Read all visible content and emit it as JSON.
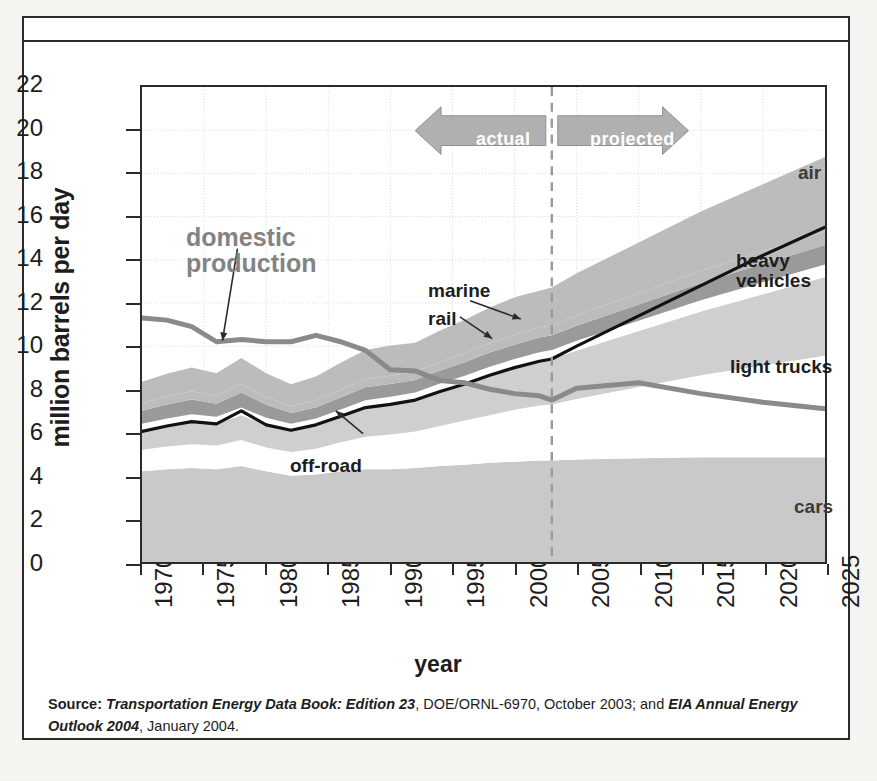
{
  "figure": {
    "ylabel": "million barrels per day",
    "xlabel": "year",
    "source_prefix": "Source:",
    "source_italic_1": "Transportation Energy Data Book: Edition 23",
    "source_mid": ", DOE/ORNL-6970, October 2003; and ",
    "source_italic_2": "EIA Annual Energy Outlook 2004",
    "source_tail": ", January 2004."
  },
  "annotations": {
    "domestic_production": "domestic\nproduction",
    "domestic_production_line1": "domestic",
    "domestic_production_line2": "production",
    "marine": "marine",
    "rail": "rail",
    "off_road": "off-road",
    "air": "air",
    "heavy_vehicles_line1": "heavy",
    "heavy_vehicles_line2": "vehicles",
    "light_trucks": "light trucks",
    "cars": "cars",
    "actual": "actual",
    "projected": "projected"
  },
  "colors": {
    "cars_band": "#c9c9c9",
    "light_trucks_band": "#ffffff",
    "heavy_vehicles_band": "#cfcfcf",
    "rail_band": "#ffffff",
    "marine_band": "#9a9a9a",
    "air_band": "#bcbcbc",
    "total_line": "#111111",
    "domestic_line": "#8a8a8a",
    "axis": "#2b2b2b",
    "grid": "#d8d8d8",
    "divider": "#9a9a9a",
    "arrow_fill": "#b0b0b0"
  },
  "chart_data": {
    "type": "area",
    "title": "",
    "subtitle": "",
    "xlabel": "year",
    "ylabel": "million barrels per day",
    "xlim": [
      1970,
      2025
    ],
    "ylim": [
      0,
      22
    ],
    "yticks": [
      0,
      2,
      4,
      6,
      8,
      10,
      12,
      14,
      16,
      18,
      20,
      22
    ],
    "xticks": [
      1970,
      1975,
      1980,
      1985,
      1990,
      1995,
      2000,
      2005,
      2010,
      2015,
      2020,
      2025
    ],
    "grid": true,
    "legend": "inline-labels-right",
    "stacked": true,
    "divider_year": 2003,
    "divider_label_left": "actual",
    "divider_label_right": "projected",
    "x": [
      1970,
      1972,
      1974,
      1976,
      1978,
      1980,
      1982,
      1984,
      1986,
      1988,
      1990,
      1992,
      1994,
      1996,
      1998,
      2000,
      2002,
      2003,
      2005,
      2010,
      2015,
      2020,
      2025
    ],
    "series": [
      {
        "name": "cars",
        "order": 1,
        "values": [
          4.2,
          4.3,
          4.35,
          4.3,
          4.45,
          4.2,
          4.0,
          4.05,
          4.2,
          4.3,
          4.3,
          4.35,
          4.45,
          4.5,
          4.6,
          4.65,
          4.7,
          4.7,
          4.75,
          4.8,
          4.85,
          4.85,
          4.85
        ]
      },
      {
        "name": "light trucks",
        "order": 2,
        "values": [
          1.0,
          1.05,
          1.1,
          1.1,
          1.2,
          1.1,
          1.1,
          1.2,
          1.35,
          1.5,
          1.6,
          1.7,
          1.85,
          2.05,
          2.2,
          2.4,
          2.55,
          2.6,
          2.8,
          3.3,
          3.8,
          4.25,
          4.7
        ]
      },
      {
        "name": "heavy vehicles",
        "order": 3,
        "values": [
          0.85,
          0.95,
          1.05,
          1.0,
          1.15,
          1.05,
          1.0,
          1.1,
          1.2,
          1.35,
          1.4,
          1.45,
          1.6,
          1.7,
          1.85,
          1.95,
          2.05,
          2.1,
          2.25,
          2.6,
          2.95,
          3.3,
          3.65
        ]
      },
      {
        "name": "rail",
        "order": 4,
        "values": [
          0.35,
          0.35,
          0.35,
          0.33,
          0.35,
          0.33,
          0.3,
          0.3,
          0.32,
          0.34,
          0.35,
          0.35,
          0.37,
          0.38,
          0.4,
          0.4,
          0.42,
          0.42,
          0.44,
          0.48,
          0.52,
          0.55,
          0.58
        ]
      },
      {
        "name": "marine",
        "order": 5,
        "values": [
          0.6,
          0.65,
          0.68,
          0.6,
          0.7,
          0.6,
          0.5,
          0.5,
          0.55,
          0.6,
          0.6,
          0.58,
          0.6,
          0.62,
          0.65,
          0.66,
          0.68,
          0.68,
          0.7,
          0.75,
          0.8,
          0.85,
          0.9
        ]
      },
      {
        "name": "off-road",
        "order": 6,
        "values": [
          0.35,
          0.37,
          0.38,
          0.36,
          0.4,
          0.36,
          0.33,
          0.34,
          0.36,
          0.38,
          0.38,
          0.38,
          0.4,
          0.42,
          0.44,
          0.45,
          0.46,
          0.46,
          0.48,
          0.52,
          0.56,
          0.6,
          0.63
        ]
      },
      {
        "name": "air",
        "order": 7,
        "values": [
          1.0,
          1.05,
          1.1,
          1.05,
          1.2,
          1.1,
          1.0,
          1.1,
          1.25,
          1.35,
          1.4,
          1.35,
          1.45,
          1.55,
          1.65,
          1.75,
          1.7,
          1.75,
          1.95,
          2.35,
          2.75,
          3.1,
          3.45
        ]
      }
    ],
    "lines": [
      {
        "name": "total transportation (through heavy vehicles)",
        "style": "solid-black",
        "values": [
          6.05,
          6.3,
          6.5,
          6.4,
          7.0,
          6.35,
          6.1,
          6.35,
          6.75,
          7.15,
          7.3,
          7.5,
          7.9,
          8.25,
          8.65,
          9.0,
          9.3,
          9.4,
          10.0,
          11.4,
          12.8,
          14.2,
          15.5
        ]
      },
      {
        "name": "domestic production",
        "style": "solid-grey",
        "values": [
          11.3,
          11.2,
          10.9,
          10.2,
          10.3,
          10.2,
          10.2,
          10.5,
          10.2,
          9.8,
          8.9,
          8.85,
          8.4,
          8.3,
          8.0,
          7.8,
          7.7,
          7.5,
          8.05,
          8.3,
          7.8,
          7.4,
          7.1
        ]
      }
    ],
    "band_top_total": [
      7.15,
      7.42,
      7.66,
      7.44,
      8.25,
      7.44,
      7.13,
      7.39,
      7.93,
      8.42,
      8.63,
      8.76,
      9.22,
      9.62,
      10.09,
      10.51,
      10.86,
      10.99,
      11.67,
      13.25,
      14.83,
      16.4,
      17.96
    ]
  }
}
